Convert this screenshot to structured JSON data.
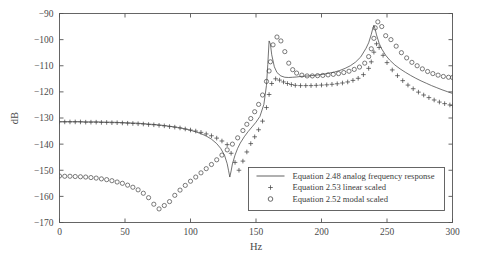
{
  "chart_data": {
    "type": "line",
    "title": "",
    "xlabel": "Hz",
    "ylabel": "dB",
    "xlim": [
      0,
      300
    ],
    "ylim": [
      -170,
      -90
    ],
    "xticks": [
      0,
      50,
      100,
      150,
      200,
      250,
      300
    ],
    "yticks": [
      -90,
      -100,
      -110,
      -120,
      -130,
      -140,
      -150,
      -160,
      -170
    ],
    "xticklabels": [
      "0",
      "50",
      "100",
      "150",
      "200",
      "250",
      "300"
    ],
    "yticklabels": [
      "−90",
      "−100",
      "−110",
      "−120",
      "−130",
      "−140",
      "−150",
      "−160",
      "−170"
    ],
    "grid": false,
    "legend_position": "lower right",
    "legend": [
      {
        "label": "Equation 2.48 analog frequency response",
        "marker": "line"
      },
      {
        "label": "Equation 2.53 linear scaled",
        "marker": "plus"
      },
      {
        "label": "Equation 2.52 modal scaled",
        "marker": "circle"
      }
    ],
    "series": [
      {
        "name": "Equation 2.48 analog frequency response",
        "marker": "line",
        "color": "#444444",
        "x": [
          0,
          5,
          10,
          15,
          20,
          25,
          30,
          35,
          40,
          45,
          50,
          55,
          60,
          65,
          70,
          75,
          80,
          85,
          90,
          95,
          100,
          104,
          108,
          112,
          116,
          120,
          123,
          126,
          128,
          129,
          130,
          131,
          132,
          134,
          136,
          138,
          141,
          144,
          147,
          150,
          153,
          156,
          158,
          159,
          160,
          161,
          162,
          164,
          166,
          169,
          172,
          175,
          178,
          181,
          184,
          187,
          190,
          194,
          198,
          202,
          206,
          210,
          214,
          218,
          222,
          226,
          230,
          234,
          236,
          238,
          239,
          240,
          241,
          242,
          244,
          246,
          249,
          252,
          256,
          260,
          264,
          268,
          272,
          276,
          280,
          284,
          288,
          292,
          296,
          300
        ],
        "y": [
          -131.4,
          -131.4,
          -131.4,
          -131.4,
          -131.5,
          -131.5,
          -131.5,
          -131.6,
          -131.6,
          -131.7,
          -131.8,
          -131.9,
          -132.0,
          -132.2,
          -132.4,
          -132.6,
          -132.9,
          -133.2,
          -133.6,
          -134.1,
          -134.7,
          -135.3,
          -136.0,
          -136.9,
          -138.1,
          -139.8,
          -141.6,
          -144.3,
          -147.5,
          -150.0,
          -152.6,
          -150.3,
          -147.6,
          -144.2,
          -141.6,
          -139.6,
          -137.2,
          -135.2,
          -133.4,
          -131.6,
          -129.4,
          -124.8,
          -117.5,
          -109.5,
          -100.5,
          -101.7,
          -105.8,
          -110.4,
          -112.6,
          -113.9,
          -114.4,
          -114.5,
          -114.4,
          -114.3,
          -114.1,
          -114.0,
          -113.9,
          -113.7,
          -113.5,
          -113.2,
          -112.8,
          -112.4,
          -111.8,
          -111.0,
          -110.0,
          -108.6,
          -106.6,
          -103.3,
          -101.2,
          -98.0,
          -96.0,
          -94.5,
          -96.1,
          -98.2,
          -101.4,
          -103.6,
          -106.0,
          -107.8,
          -109.7,
          -111.2,
          -112.5,
          -113.7,
          -114.8,
          -115.8,
          -116.7,
          -117.6,
          -118.4,
          -119.2,
          -119.9,
          -120.6
        ]
      },
      {
        "name": "Equation 2.53 linear scaled",
        "marker": "plus",
        "color": "#444444",
        "x": [
          0,
          4,
          8,
          12,
          16,
          20,
          24,
          28,
          32,
          36,
          40,
          44,
          48,
          52,
          56,
          60,
          64,
          68,
          72,
          76,
          80,
          84,
          88,
          92,
          96,
          100,
          104,
          108,
          112,
          116,
          120,
          124,
          128,
          131,
          134,
          137,
          140,
          143,
          146,
          149,
          152,
          155,
          158,
          160,
          162,
          165,
          168,
          171,
          174,
          177,
          180,
          184,
          188,
          192,
          196,
          200,
          204,
          208,
          212,
          216,
          220,
          224,
          228,
          232,
          236,
          238,
          240,
          242,
          244,
          247,
          250,
          254,
          258,
          262,
          266,
          270,
          274,
          278,
          282,
          286,
          290,
          294,
          298,
          300
        ],
        "y": [
          -131.5,
          -131.5,
          -131.5,
          -131.5,
          -131.5,
          -131.6,
          -131.6,
          -131.6,
          -131.7,
          -131.7,
          -131.8,
          -131.8,
          -131.9,
          -132.0,
          -132.1,
          -132.2,
          -132.3,
          -132.5,
          -132.6,
          -132.8,
          -133.0,
          -133.3,
          -133.5,
          -133.8,
          -134.2,
          -134.6,
          -135.0,
          -135.5,
          -136.1,
          -136.8,
          -137.7,
          -138.8,
          -140.2,
          -143.5,
          -147.0,
          -150.0,
          -146.5,
          -143.0,
          -139.8,
          -137.2,
          -134.5,
          -131.2,
          -126.0,
          -121.0,
          -116.8,
          -115.0,
          -115.5,
          -116.2,
          -116.8,
          -117.2,
          -117.5,
          -117.6,
          -117.6,
          -117.6,
          -117.5,
          -117.4,
          -117.3,
          -117.1,
          -116.9,
          -116.6,
          -116.2,
          -115.6,
          -114.8,
          -113.4,
          -111.0,
          -108.5,
          -104.8,
          -101.6,
          -103.0,
          -106.0,
          -108.8,
          -111.6,
          -113.8,
          -115.7,
          -117.4,
          -118.8,
          -120.1,
          -121.2,
          -122.2,
          -123.1,
          -123.9,
          -124.5,
          -125.0,
          -125.2
        ]
      },
      {
        "name": "Equation 2.52 modal scaled",
        "marker": "circle",
        "color": "#444444",
        "x": [
          0,
          4,
          8,
          12,
          16,
          20,
          24,
          28,
          32,
          36,
          40,
          44,
          48,
          52,
          56,
          60,
          64,
          68,
          72,
          76,
          80,
          84,
          88,
          92,
          96,
          100,
          104,
          108,
          112,
          116,
          120,
          124,
          128,
          132,
          136,
          140,
          143,
          146,
          149,
          152,
          155,
          158,
          160,
          161,
          163,
          166,
          169,
          172,
          175,
          178,
          181,
          185,
          189,
          193,
          197,
          201,
          205,
          209,
          213,
          217,
          221,
          225,
          229,
          233,
          236,
          238,
          240,
          241,
          243,
          246,
          249,
          253,
          257,
          261,
          265,
          269,
          273,
          277,
          281,
          285,
          289,
          293,
          297,
          300
        ],
        "y": [
          -152.2,
          -152.3,
          -152.3,
          -152.4,
          -152.5,
          -152.6,
          -152.8,
          -153.0,
          -153.3,
          -153.6,
          -154.0,
          -154.5,
          -155.0,
          -155.7,
          -156.5,
          -157.5,
          -158.8,
          -160.5,
          -163.0,
          -164.8,
          -163.5,
          -162.0,
          -159.6,
          -157.6,
          -155.8,
          -154.2,
          -152.6,
          -151.0,
          -149.4,
          -147.8,
          -146.0,
          -144.2,
          -142.2,
          -140.0,
          -137.6,
          -134.8,
          -132.4,
          -130.2,
          -127.6,
          -124.8,
          -121.2,
          -116.0,
          -112.0,
          -108.5,
          -102.0,
          -99.0,
          -100.5,
          -104.6,
          -109.0,
          -111.5,
          -112.8,
          -113.6,
          -113.9,
          -113.9,
          -113.8,
          -113.7,
          -113.5,
          -113.3,
          -113.0,
          -112.6,
          -112.1,
          -111.4,
          -110.5,
          -109.0,
          -106.5,
          -103.5,
          -99.5,
          -95.5,
          -93.2,
          -95.0,
          -98.5,
          -100.0,
          -102.5,
          -105.0,
          -107.0,
          -108.7,
          -110.0,
          -111.2,
          -112.2,
          -113.0,
          -113.6,
          -114.1,
          -114.4,
          -114.5
        ]
      }
    ]
  },
  "figure": {
    "background": "#ffffff",
    "axes_color": "#555555",
    "line_color": "#444444"
  }
}
